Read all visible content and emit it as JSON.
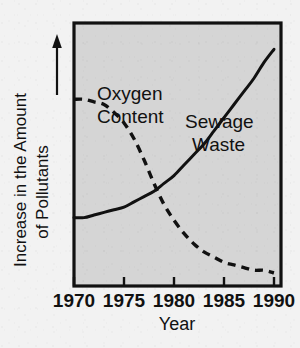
{
  "chart_data": {
    "type": "line",
    "title": "",
    "xlabel": "Year",
    "ylabel": "Increase in the Amount of Pollutants",
    "ylabel_line1": "Increase in the Amount",
    "ylabel_line2": "of Pollutants",
    "ylabel_arrow": "up-arrow",
    "x": [
      1970,
      1975,
      1980,
      1985,
      1990
    ],
    "xticklabels": [
      "1970",
      "1975",
      "1980",
      "1985",
      "1990"
    ],
    "xlim": [
      1970,
      1990.7
    ],
    "ylim": [
      0,
      100
    ],
    "yticklabels": [],
    "grid": false,
    "legend": "inline-annotations",
    "plot_bgcolor": "#d5d5d5",
    "page_bgcolor": "#f2f2f2",
    "axis_color": "#111111",
    "series": [
      {
        "name": "Oxygen Content",
        "label_line1": "Oxygen",
        "label_line2": "Content",
        "style": "dashed",
        "color": "#111111",
        "x": [
          1970,
          1971,
          1972,
          1973,
          1974,
          1975,
          1976,
          1977,
          1978,
          1979,
          1980,
          1981,
          1982,
          1983,
          1984,
          1985,
          1986,
          1987,
          1988,
          1989,
          1990
        ],
        "values": [
          71,
          71,
          70,
          69,
          66,
          62,
          56,
          48,
          39,
          31,
          25,
          20,
          16,
          13,
          11,
          9,
          8,
          7,
          6,
          6,
          5
        ]
      },
      {
        "name": "Sewage Waste",
        "label_line1": "Sewage",
        "label_line2": "Waste",
        "style": "solid",
        "color": "#111111",
        "x": [
          1970,
          1971,
          1972,
          1973,
          1974,
          1975,
          1976,
          1977,
          1978,
          1979,
          1980,
          1981,
          1982,
          1983,
          1984,
          1985,
          1986,
          1987,
          1988,
          1989,
          1990
        ],
        "values": [
          26,
          26,
          27,
          28,
          29,
          30,
          32,
          34,
          36,
          39,
          42,
          46,
          50,
          54,
          59,
          64,
          69,
          74,
          79,
          85,
          90
        ]
      }
    ],
    "annotations": [
      {
        "text": "Oxygen Content",
        "x": 1974.5,
        "y": 88
      },
      {
        "text": "Sewage Waste",
        "x": 1982.5,
        "y": 76
      }
    ]
  }
}
